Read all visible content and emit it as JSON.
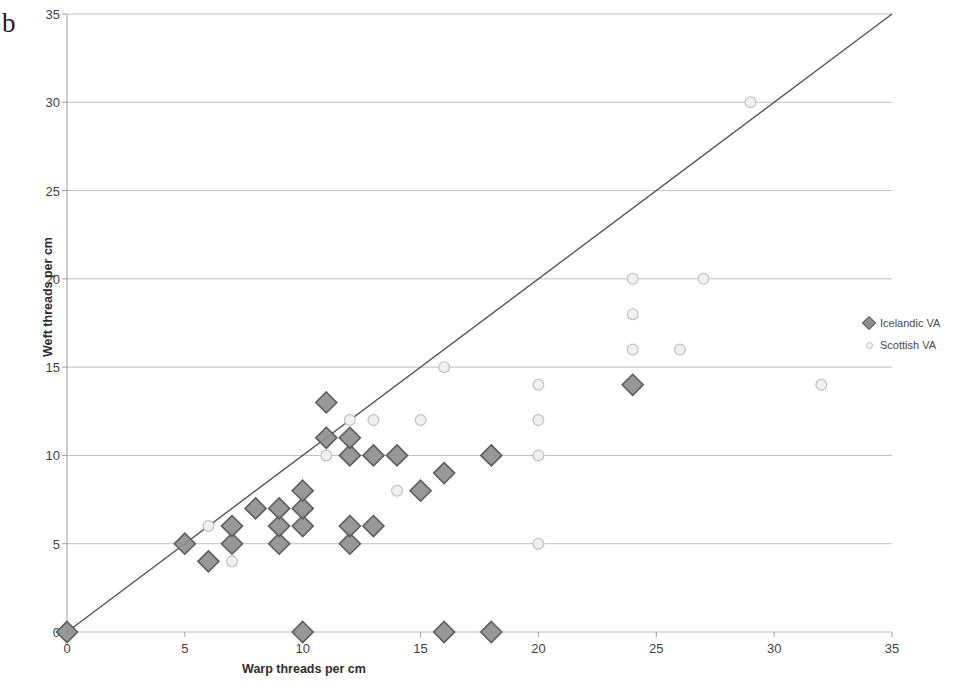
{
  "panel": {
    "label": "b"
  },
  "axes": {
    "x_title": "Warp threads per cm",
    "y_title": "Weft threads per cm",
    "x_ticks": [
      "0",
      "5",
      "10",
      "15",
      "20",
      "25",
      "30",
      "35"
    ],
    "y_ticks": [
      "0",
      "5",
      "10",
      "15",
      "20",
      "25",
      "30",
      "35"
    ]
  },
  "legend": {
    "position": "right",
    "items": [
      {
        "label": "Icelandic VA",
        "marker": "diamond-icon",
        "color": "#8f8f8f"
      },
      {
        "label": "Scottish VA",
        "marker": "circle-icon",
        "color": "#e8e8e8"
      }
    ]
  },
  "chart_data": {
    "type": "scatter",
    "title": "",
    "subtitle": "",
    "xlabel": "Warp threads per cm",
    "ylabel": "Weft threads per cm",
    "xlim": [
      0,
      35
    ],
    "ylim": [
      0,
      35
    ],
    "xticks": [
      0,
      5,
      10,
      15,
      20,
      25,
      30,
      35
    ],
    "yticks": [
      0,
      5,
      10,
      15,
      20,
      25,
      30,
      35
    ],
    "grid": "horizontal",
    "legend_position": "right",
    "reference_line": {
      "label": "1:1 line",
      "from": [
        0,
        0
      ],
      "to": [
        35,
        35
      ],
      "color": "#555555"
    },
    "series": [
      {
        "name": "Icelandic VA",
        "marker": "diamond",
        "color": "#8f8f8f",
        "edge_color": "#5c5c5c",
        "points": [
          [
            0,
            0
          ],
          [
            10,
            0
          ],
          [
            16,
            0
          ],
          [
            18,
            0
          ],
          [
            5,
            5
          ],
          [
            6,
            4
          ],
          [
            7,
            5
          ],
          [
            7,
            6
          ],
          [
            8,
            7
          ],
          [
            9,
            5
          ],
          [
            9,
            6
          ],
          [
            9,
            7
          ],
          [
            10,
            6
          ],
          [
            10,
            7
          ],
          [
            10,
            8
          ],
          [
            11,
            11
          ],
          [
            11,
            13
          ],
          [
            12,
            5
          ],
          [
            12,
            6
          ],
          [
            12,
            10
          ],
          [
            12,
            11
          ],
          [
            13,
            6
          ],
          [
            13,
            10
          ],
          [
            14,
            10
          ],
          [
            15,
            8
          ],
          [
            16,
            9
          ],
          [
            18,
            10
          ],
          [
            24,
            14
          ]
        ]
      },
      {
        "name": "Scottish VA",
        "marker": "circle",
        "color": "#f0f0f0",
        "edge_color": "#c0c0c0",
        "points": [
          [
            6,
            6
          ],
          [
            7,
            4
          ],
          [
            10,
            7
          ],
          [
            11,
            10
          ],
          [
            12,
            12
          ],
          [
            13,
            12
          ],
          [
            14,
            8
          ],
          [
            15,
            12
          ],
          [
            16,
            15
          ],
          [
            20,
            5
          ],
          [
            20,
            10
          ],
          [
            20,
            12
          ],
          [
            20,
            14
          ],
          [
            24,
            16
          ],
          [
            24,
            18
          ],
          [
            24,
            20
          ],
          [
            24,
            14
          ],
          [
            26,
            16
          ],
          [
            27,
            20
          ],
          [
            29,
            30
          ],
          [
            32,
            14
          ]
        ]
      }
    ]
  }
}
